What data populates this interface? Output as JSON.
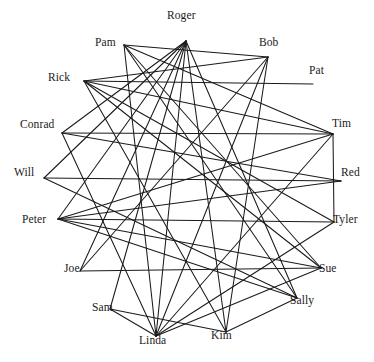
{
  "diagram": {
    "type": "circular-network-sociogram",
    "title": "",
    "background_color": "#ffffff",
    "edge_color": "#1a1a1a",
    "edge_width": 1.05,
    "label_color": "#1a1a1a",
    "node_count": 18,
    "edge_count": 40,
    "layout": "circle",
    "center": {
      "x": 187,
      "y": 181
    },
    "radius": 148
  },
  "nodes": [
    {
      "id": "roger",
      "label": "Roger",
      "x": 186,
      "y": 33,
      "anchor_x": 186,
      "anchor_y": 41,
      "label_x": 167,
      "label_y": 10
    },
    {
      "id": "bob",
      "label": "Bob",
      "x": 270,
      "y": 49,
      "anchor_x": 268,
      "anchor_y": 57,
      "label_x": 259,
      "label_y": 37
    },
    {
      "id": "pat",
      "label": "Pat",
      "x": 318,
      "y": 76,
      "anchor_x": 313,
      "anchor_y": 84,
      "label_x": 309,
      "label_y": 65
    },
    {
      "id": "tim",
      "label": "Tim",
      "x": 341,
      "y": 129,
      "anchor_x": 333,
      "anchor_y": 134,
      "label_x": 332,
      "label_y": 118
    },
    {
      "id": "red",
      "label": "Red",
      "x": 351,
      "y": 178,
      "anchor_x": 341,
      "anchor_y": 181,
      "label_x": 341,
      "label_y": 167
    },
    {
      "id": "tyler",
      "label": "Tyler",
      "x": 343,
      "y": 225,
      "anchor_x": 334,
      "anchor_y": 222,
      "label_x": 333,
      "label_y": 214
    },
    {
      "id": "sue",
      "label": "Sue",
      "x": 329,
      "y": 274,
      "anchor_x": 321,
      "anchor_y": 268,
      "label_x": 319,
      "label_y": 263
    },
    {
      "id": "sally",
      "label": "Sally",
      "x": 304,
      "y": 306,
      "anchor_x": 297,
      "anchor_y": 298,
      "label_x": 290,
      "label_y": 295
    },
    {
      "id": "kim",
      "label": "Kim",
      "x": 222,
      "y": 341,
      "anchor_x": 226,
      "anchor_y": 332,
      "label_x": 211,
      "label_y": 330
    },
    {
      "id": "linda",
      "label": "Linda",
      "x": 156,
      "y": 346,
      "anchor_x": 156,
      "anchor_y": 336,
      "label_x": 139,
      "label_y": 335
    },
    {
      "id": "sam",
      "label": "Sam",
      "x": 103,
      "y": 313,
      "anchor_x": 110,
      "anchor_y": 309,
      "label_x": 92,
      "label_y": 302
    },
    {
      "id": "joe",
      "label": "Joe",
      "x": 72,
      "y": 274,
      "anchor_x": 80,
      "anchor_y": 271,
      "label_x": 64,
      "label_y": 263
    },
    {
      "id": "peter",
      "label": "Peter",
      "x": 38,
      "y": 225,
      "anchor_x": 58,
      "anchor_y": 219,
      "label_x": 22,
      "label_y": 214
    },
    {
      "id": "will",
      "label": "Will",
      "x": 26,
      "y": 178,
      "anchor_x": 44,
      "anchor_y": 178,
      "label_x": 14,
      "label_y": 167
    },
    {
      "id": "conrad",
      "label": "Conrad",
      "x": 42,
      "y": 130,
      "anchor_x": 62,
      "anchor_y": 133,
      "label_x": 20,
      "label_y": 119
    },
    {
      "id": "rick",
      "label": "Rick",
      "x": 64,
      "y": 84,
      "anchor_x": 84,
      "anchor_y": 81,
      "label_x": 48,
      "label_y": 72
    },
    {
      "id": "pam",
      "label": "Pam",
      "x": 110,
      "y": 49,
      "anchor_x": 124,
      "anchor_y": 45,
      "label_x": 95,
      "label_y": 37
    },
    {
      "id": "bobtop",
      "label": "Bob",
      "x": 270,
      "y": 49,
      "anchor_x": 268,
      "anchor_y": 57,
      "label_x": 259,
      "label_y": 37,
      "hidden": true
    }
  ],
  "edges": [
    {
      "source": "roger",
      "target": "peter"
    },
    {
      "source": "roger",
      "target": "will"
    },
    {
      "source": "roger",
      "target": "conrad"
    },
    {
      "source": "roger",
      "target": "joe"
    },
    {
      "source": "roger",
      "target": "sam"
    },
    {
      "source": "roger",
      "target": "linda"
    },
    {
      "source": "roger",
      "target": "kim"
    },
    {
      "source": "roger",
      "target": "sally"
    },
    {
      "source": "pam",
      "target": "bob"
    },
    {
      "source": "pam",
      "target": "tim"
    },
    {
      "source": "pam",
      "target": "sue"
    },
    {
      "source": "pam",
      "target": "linda"
    },
    {
      "source": "pam",
      "target": "sally"
    },
    {
      "source": "rick",
      "target": "bob"
    },
    {
      "source": "rick",
      "target": "pat"
    },
    {
      "source": "rick",
      "target": "tim"
    },
    {
      "source": "rick",
      "target": "tyler"
    },
    {
      "source": "rick",
      "target": "sue"
    },
    {
      "source": "rick",
      "target": "kim"
    },
    {
      "source": "conrad",
      "target": "tim"
    },
    {
      "source": "conrad",
      "target": "red"
    },
    {
      "source": "conrad",
      "target": "linda"
    },
    {
      "source": "will",
      "target": "red"
    },
    {
      "source": "will",
      "target": "sally"
    },
    {
      "source": "peter",
      "target": "tim"
    },
    {
      "source": "peter",
      "target": "red"
    },
    {
      "source": "peter",
      "target": "tyler"
    },
    {
      "source": "peter",
      "target": "sue"
    },
    {
      "source": "peter",
      "target": "sally"
    },
    {
      "source": "joe",
      "target": "bob"
    },
    {
      "source": "joe",
      "target": "sue"
    },
    {
      "source": "sam",
      "target": "linda"
    },
    {
      "source": "sam",
      "target": "kim"
    },
    {
      "source": "linda",
      "target": "bob"
    },
    {
      "source": "linda",
      "target": "tim"
    },
    {
      "source": "linda",
      "target": "tyler"
    },
    {
      "source": "linda",
      "target": "sue"
    },
    {
      "source": "kim",
      "target": "bob"
    },
    {
      "source": "kim",
      "target": "sally"
    },
    {
      "source": "tim",
      "target": "tyler"
    }
  ]
}
